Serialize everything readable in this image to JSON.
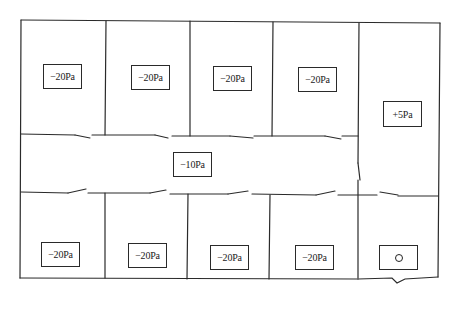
{
  "diagram": {
    "type": "pressure-zoning floor plan",
    "line_color": "#2a2a2a",
    "rooms_top": [
      {
        "id": "top-1",
        "label": "−20Pa"
      },
      {
        "id": "top-2",
        "label": "−20Pa"
      },
      {
        "id": "top-3",
        "label": "−20Pa"
      },
      {
        "id": "top-4",
        "label": "−20Pa"
      }
    ],
    "corridor": {
      "label": "−10Pa"
    },
    "right_room_top": {
      "label": "+5Pa"
    },
    "rooms_bottom": [
      {
        "id": "bottom-1",
        "label": "−20Pa"
      },
      {
        "id": "bottom-2",
        "label": "−20Pa"
      },
      {
        "id": "bottom-3",
        "label": "−20Pa"
      },
      {
        "id": "bottom-4",
        "label": "−20Pa"
      }
    ],
    "right_room_bottom": {
      "label": "",
      "symbol": "circle"
    }
  }
}
